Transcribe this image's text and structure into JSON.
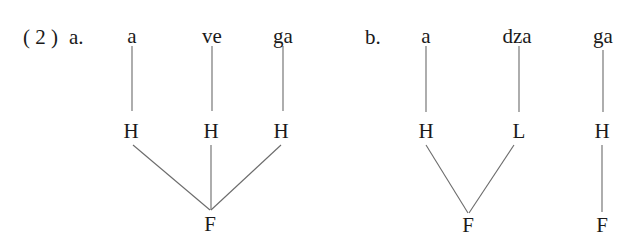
{
  "example": {
    "number": "( 2 )",
    "part_a": {
      "label": "a.",
      "syllables": [
        "a",
        "ve",
        "ga"
      ],
      "tones": [
        "H",
        "H",
        "H"
      ],
      "feet": [
        "F"
      ]
    },
    "part_b": {
      "label": "b.",
      "syllables": [
        "a",
        "dza",
        "ga"
      ],
      "tones": [
        "H",
        "L",
        "H"
      ],
      "feet": [
        "F",
        "F"
      ]
    }
  },
  "colors": {
    "text": "#1a1a1a",
    "lines": "#6b6b6b",
    "background": "#ffffff"
  }
}
